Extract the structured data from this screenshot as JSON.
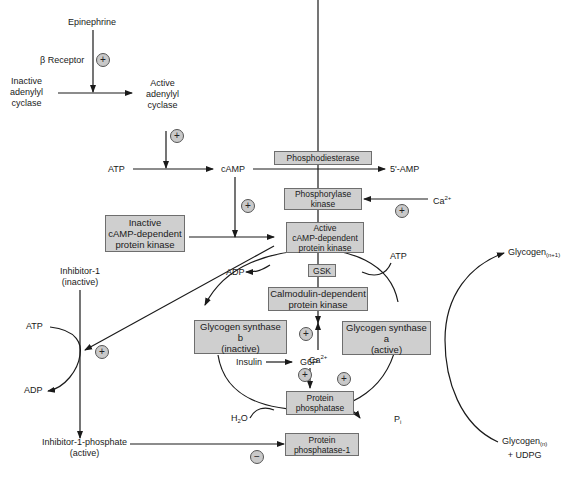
{
  "labels": {
    "epinephrine": "Epinephrine",
    "beta_receptor": "β Receptor",
    "inactive_adenylyl_cyclase": [
      "Inactive",
      "adenylyl",
      "cyclase"
    ],
    "active_adenylyl_cyclase": [
      "Active",
      "adenylyl",
      "cyclase"
    ],
    "atp_top": "ATP",
    "camp": "cAMP",
    "five_amp": "5'-AMP",
    "ca_top": "Ca",
    "ca_top_sup": "2+",
    "inhibitor1": [
      "Inhibitor-1",
      "(inactive)"
    ],
    "atp_left": "ATP",
    "adp_left": "ADP",
    "adp_mid": "ADP",
    "atp_right": "ATP",
    "ca_mid": "Ca",
    "ca_mid_sup": "2+",
    "insulin": "Insulin",
    "g6p": "G6P",
    "h2o": "H",
    "h2o_sub": "2",
    "h2o_end": "O",
    "pi": "P",
    "pi_sub": "i",
    "inhibitor1_phosphate": [
      "Inhibitor-1-phosphate",
      "(active)"
    ],
    "glycogen_n1": "Glycogen",
    "glycogen_n1_sub": "(n+1)",
    "glycogen_n": "Glycogen",
    "glycogen_n_sub": "(n)",
    "udpg": "+ UDPG"
  },
  "boxes": {
    "phosphodiesterase": [
      "Phosphodiesterase"
    ],
    "phosphorylase_kinase": [
      "Phosphorylase",
      "kinase"
    ],
    "inactive_pka": [
      "Inactive",
      "cAMP-dependent",
      "protein kinase"
    ],
    "active_pka": [
      "Active",
      "cAMP-dependent",
      "protein kinase"
    ],
    "gsk": [
      "GSK"
    ],
    "calmodulin_kinase": [
      "Calmodulin-dependent",
      "protein kinase"
    ],
    "glycogen_synthase_b": [
      "Glycogen synthase",
      "b",
      "(inactive)"
    ],
    "glycogen_synthase_a": [
      "Glycogen synthase",
      "a",
      "(active)"
    ],
    "protein_phosphatase": [
      "Protein",
      "phosphatase"
    ],
    "protein_phosphatase_1": [
      "Protein",
      "phosphatase-1"
    ]
  },
  "signs": {
    "plus": "+",
    "minus": "−"
  },
  "colors": {
    "box_fill": "#cfcfcf",
    "box_border": "#6e6e6e",
    "line": "#1a1a1a",
    "sign_fill": "#c9c9c9"
  }
}
